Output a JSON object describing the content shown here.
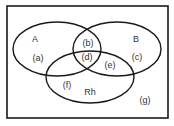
{
  "diagram": {
    "type": "venn",
    "colors": {
      "stroke": "#1a1a1a",
      "text": "#333333",
      "background": "#ffffff"
    },
    "sets": [
      {
        "id": "A",
        "label": "A"
      },
      {
        "id": "B",
        "label": "B"
      },
      {
        "id": "Rh",
        "label": "Rh"
      }
    ],
    "regions": {
      "a": "(a)",
      "b": "(b)",
      "c": "(c)",
      "d": "(d)",
      "e": "(e)",
      "f": "(f)",
      "g": "(g)"
    }
  }
}
